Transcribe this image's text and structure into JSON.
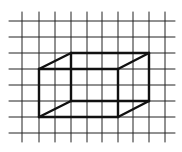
{
  "diagram": {
    "type": "isometric-box-on-grid",
    "background": "#ffffff",
    "grid": {
      "color": "#222222",
      "line_width": 1,
      "vertical_x": [
        22,
        39,
        55,
        71,
        87,
        102,
        118,
        133,
        149,
        165
      ],
      "vertical_y_range": [
        12,
        142
      ],
      "horizontal_y": [
        21,
        37,
        53,
        69,
        85,
        101,
        117,
        133
      ],
      "horizontal_x_range": [
        9,
        175
      ]
    },
    "box": {
      "color": "#111111",
      "line_width": 2.4,
      "front": {
        "x1": 39,
        "y1": 69,
        "x2": 118,
        "y2": 117
      },
      "back": {
        "x1": 71,
        "y1": 53,
        "x2": 149,
        "y2": 101
      }
    }
  }
}
